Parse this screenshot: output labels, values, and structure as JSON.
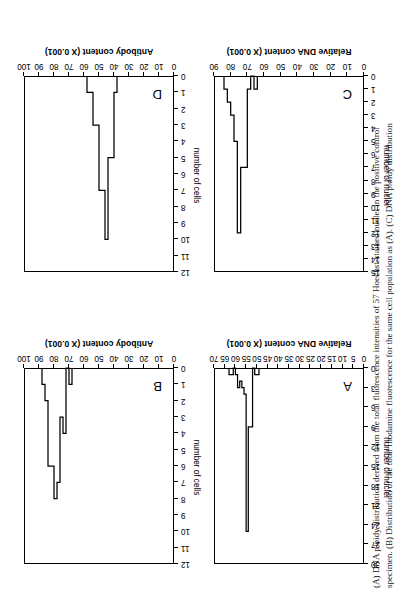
{
  "figure": {
    "caption_lines": [
      "(A) DNA ploidy distribution derived from the total fluorescence intensities of 57 Hoechst-stained nuclei in the positive control",
      "specimen. (B) Distribution of the total rhodamine fluorescence for the same cell population as (A). (C) DNA ploidy distribution"
    ]
  },
  "chart_data": [
    {
      "id": "A",
      "type": "bar",
      "panel_letter": "A",
      "title": "",
      "xlabel": "Relative DNA content (X 0.001)",
      "ylabel": "number of nuclei",
      "xlim": [
        0,
        70
      ],
      "ylim": [
        0,
        30
      ],
      "xticks": [
        0,
        5,
        10,
        15,
        20,
        25,
        30,
        35,
        40,
        45,
        50,
        55,
        60,
        65,
        70
      ],
      "yticks": [
        0,
        3,
        6,
        9,
        12,
        15,
        18,
        21,
        24,
        27,
        30
      ],
      "grid": false,
      "legend": "none",
      "bin_width": 1,
      "bin_starts": [
        49,
        50,
        51,
        52,
        53,
        54,
        55,
        56,
        57,
        58,
        59,
        60,
        61,
        62
      ],
      "values": [
        1,
        1,
        0,
        9,
        9,
        25,
        4,
        3,
        2,
        3,
        1,
        0,
        1,
        1
      ]
    },
    {
      "id": "B",
      "type": "bar",
      "panel_letter": "B",
      "title": "",
      "xlabel": "Antibody content (X 0.001)",
      "ylabel": "number of cells",
      "xlim": [
        0,
        100
      ],
      "ylim": [
        0,
        12
      ],
      "xticks": [
        0,
        10,
        20,
        30,
        40,
        50,
        60,
        70,
        80,
        90,
        100
      ],
      "yticks": [
        0,
        1,
        2,
        3,
        4,
        5,
        6,
        7,
        8,
        9,
        10,
        11,
        12
      ],
      "grid": false,
      "legend": "none",
      "bin_width": 2,
      "bin_starts": [
        68,
        70,
        72,
        74,
        76,
        78,
        80,
        82,
        84,
        86
      ],
      "values": [
        1,
        0,
        4,
        3,
        7,
        8,
        6,
        6,
        2,
        1
      ]
    },
    {
      "id": "C",
      "type": "bar",
      "panel_letter": "C",
      "title": "",
      "xlabel": "Relative DNA content (X 0.001)",
      "ylabel": "number of nuclei",
      "xlim": [
        0,
        90
      ],
      "ylim": [
        0,
        15
      ],
      "xticks": [
        0,
        10,
        20,
        30,
        40,
        50,
        60,
        70,
        80,
        90
      ],
      "yticks": [
        0,
        1,
        2,
        3,
        4,
        5,
        6,
        7,
        8,
        9,
        10,
        11,
        12,
        13,
        14,
        15
      ],
      "grid": false,
      "legend": "none",
      "bin_width": 2,
      "bin_starts": [
        64,
        66,
        68,
        70,
        72,
        74,
        76,
        78,
        80,
        82
      ],
      "values": [
        1,
        0,
        1,
        7,
        7,
        12,
        5,
        3,
        2,
        1
      ]
    },
    {
      "id": "D",
      "type": "bar",
      "panel_letter": "D",
      "title": "",
      "xlabel": "Antibody content (X 0.001)",
      "ylabel": "number of cells",
      "xlim": [
        0,
        100
      ],
      "ylim": [
        0,
        12
      ],
      "xticks": [
        0,
        10,
        20,
        30,
        40,
        50,
        60,
        70,
        80,
        90,
        100
      ],
      "yticks": [
        0,
        1,
        2,
        3,
        4,
        5,
        6,
        7,
        8,
        9,
        10,
        11,
        12
      ],
      "grid": false,
      "legend": "none",
      "bin_width": 2,
      "bin_starts": [
        38,
        40,
        42,
        44,
        46,
        48,
        50,
        52,
        54,
        56
      ],
      "values": [
        1,
        5,
        5,
        10,
        7,
        7,
        3,
        3,
        1,
        1
      ]
    }
  ]
}
